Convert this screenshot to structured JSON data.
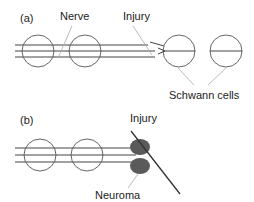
{
  "figure": {
    "background_color": "#ffffff",
    "width": 254,
    "height": 202
  },
  "panels": [
    {
      "id": "a",
      "id_label": "(a)",
      "id_x": 20,
      "id_y": 22,
      "labels": [
        {
          "name": "nerve",
          "text": "Nerve",
          "x": 60,
          "y": 20
        },
        {
          "name": "injury",
          "text": "Injury",
          "x": 123,
          "y": 20
        },
        {
          "name": "schwann-cells",
          "text": "Schwann cells",
          "x": 169,
          "y": 95
        }
      ]
    },
    {
      "id": "b",
      "id_label": "(b)",
      "id_x": 20,
      "id_y": 124,
      "labels": [
        {
          "name": "injury",
          "text": "Injury",
          "x": 130,
          "y": 122
        },
        {
          "name": "neuroma",
          "text": "Neuroma",
          "x": 95,
          "y": 196
        }
      ]
    }
  ],
  "colors": {
    "nerve_line": "#444444",
    "cell_outline": "#555555",
    "leader_line": "#aaaaaa",
    "neuroma_fill": "#5a5a5a",
    "injury_blade": "#333333",
    "text": "#222222"
  },
  "elements": {
    "panel_a": {
      "proximal_segment": {
        "name": "proximal-nerve-trunk",
        "x_start": 15,
        "x_end": 148,
        "top_line_y": 45,
        "mid_line_y": 51,
        "bottom_line_y": 57,
        "schwann_cell_centers_x": [
          38,
          85
        ],
        "cell_radius": 16
      },
      "distal_stumps": {
        "name": "distal-schwann-cell-tubes",
        "centers_x": [
          179,
          226
        ],
        "center_y": 51,
        "radius": 16
      },
      "retraction_arrows": {
        "name": "retracted-nerve-end-arrows",
        "count": 2,
        "tip_x": 164
      }
    },
    "panel_b": {
      "proximal_segment": {
        "name": "proximal-nerve-trunk",
        "x_start": 15,
        "x_end": 140,
        "top_line_y": 148,
        "mid_line_y": 155,
        "bottom_line_y": 162,
        "schwann_cell_centers_x": [
          40,
          87
        ],
        "cell_radius": 16
      },
      "neuromas": {
        "name": "neuroma-bulbs",
        "count": 2,
        "cx": 140,
        "cy_top": 147,
        "cy_bottom": 165,
        "rx": 10,
        "ry": 8
      },
      "injury_blade": {
        "name": "injury-transection-line",
        "x1": 131,
        "y1": 131,
        "x2": 180,
        "y2": 194
      }
    }
  }
}
